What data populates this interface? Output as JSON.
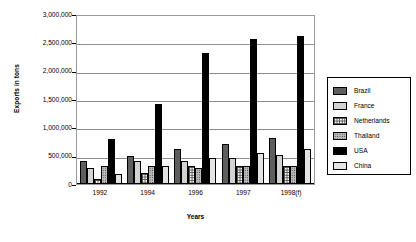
{
  "chart_data": {
    "type": "bar",
    "title": "",
    "xlabel": "Years",
    "ylabel": "Exports in tons",
    "categories": [
      "1992",
      "1994",
      "1996",
      "1997",
      "1998(f)"
    ],
    "ylim": [
      0,
      3000000
    ],
    "ytick_values": [
      0,
      500000,
      1000000,
      1500000,
      2000000,
      2500000,
      3000000
    ],
    "ytick_labels": [
      "0",
      "500,000",
      "1,000,000",
      "1,500,000",
      "2,000,000",
      "2,500,000",
      "3,000,000"
    ],
    "grid": true,
    "legend_position": "right",
    "series": [
      {
        "name": "Brazil",
        "pattern": "dark-gray-dotted",
        "values": [
          400000,
          500000,
          610000,
          710000,
          820000
        ]
      },
      {
        "name": "France",
        "pattern": "light-gray-dotted",
        "values": [
          290000,
          400000,
          410000,
          460000,
          520000
        ]
      },
      {
        "name": "Netherlands",
        "pattern": "white-grid",
        "values": [
          90000,
          200000,
          310000,
          310000,
          310000
        ]
      },
      {
        "name": "Thailand",
        "pattern": "gray-speckled",
        "values": [
          310000,
          310000,
          290000,
          310000,
          320000
        ]
      },
      {
        "name": "USA",
        "pattern": "solid-black",
        "values": [
          800000,
          1410000,
          2310000,
          2560000,
          2620000
        ]
      },
      {
        "name": "China",
        "pattern": "solid-light-gray",
        "values": [
          170000,
          310000,
          460000,
          550000,
          620000
        ]
      }
    ]
  }
}
